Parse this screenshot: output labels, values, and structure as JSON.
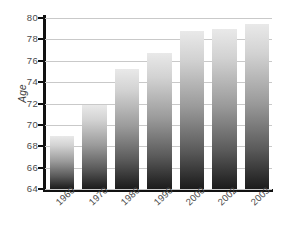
{
  "chart_data": {
    "type": "bar",
    "title": "",
    "subtitle": "",
    "xlabel": "",
    "ylabel": "Age",
    "categories": [
      "1960",
      "1970",
      "1980",
      "1990",
      "2000",
      "2002",
      "2003"
    ],
    "values": [
      69.0,
      71.9,
      75.2,
      76.7,
      78.8,
      79.0,
      79.4
    ],
    "series": [
      {
        "name": "Age",
        "values": [
          69.0,
          71.9,
          75.2,
          76.7,
          78.8,
          79.0,
          79.4
        ]
      }
    ],
    "ylim": [
      64,
      80
    ],
    "ytick_labels": [
      "64",
      "66",
      "68",
      "70",
      "72",
      "74",
      "76",
      "78",
      "80"
    ],
    "ytick_values": [
      64,
      66,
      68,
      70,
      72,
      74,
      76,
      78,
      80
    ],
    "grid": true,
    "grid_axis": "y",
    "legend": false,
    "legend_position": "none",
    "annotations": [],
    "bar_style": "vertical-gradient-grayscale",
    "x_tick_label_rotation": -43,
    "y_axis_title_rotation": -90,
    "colors": {
      "bar_top": "#e9e9e9",
      "bar_bottom": "#1c1c1c",
      "gridline": "#c9c9c9",
      "axis": "#111111",
      "tick_text": "#4a4a4a",
      "background": "#ffffff"
    }
  }
}
